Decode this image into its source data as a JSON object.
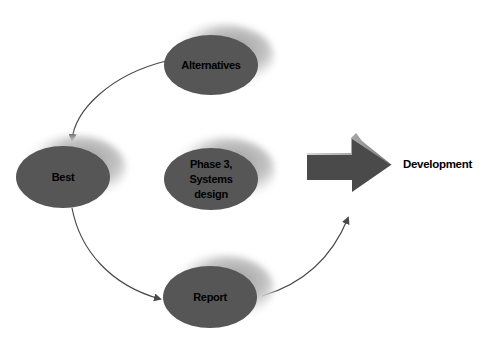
{
  "diagram": {
    "nodes": [
      {
        "id": "alternatives",
        "label_lines": [
          "Alternatives"
        ]
      },
      {
        "id": "best",
        "label_lines": [
          "Best"
        ]
      },
      {
        "id": "phase3",
        "label_lines": [
          "Phase 3,",
          "Systems",
          "design"
        ]
      },
      {
        "id": "report",
        "label_lines": [
          "Report"
        ]
      }
    ],
    "target": {
      "label": "Development"
    },
    "edges": [
      {
        "from": "alternatives",
        "to": "best"
      },
      {
        "from": "best",
        "to": "report"
      },
      {
        "from": "report",
        "to": "development-arrow"
      }
    ],
    "colors": {
      "ellipse_fill": "#565656",
      "shadow": "#b8b8b8",
      "arrow_fill": "#4a4a4a",
      "line": "#4a4a4a",
      "text": "#000000"
    }
  }
}
